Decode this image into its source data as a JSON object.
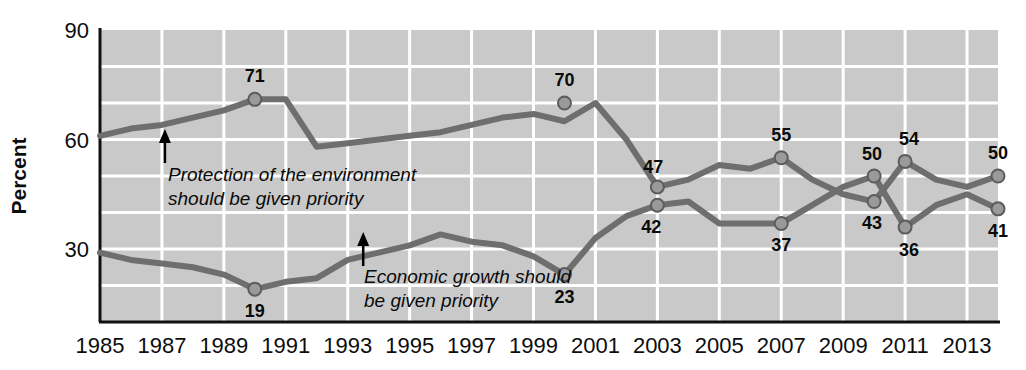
{
  "chart_data": {
    "type": "line",
    "title": "",
    "xlabel": "",
    "ylabel": "Percent",
    "ylim": [
      10,
      90
    ],
    "xlim": [
      1985,
      2014
    ],
    "grid": true,
    "legend_position": "inline-annotations",
    "y_ticks": [
      "90",
      "60",
      "30"
    ],
    "y_tick_values": [
      90,
      60,
      30
    ],
    "x_ticks": [
      "1985",
      "1987",
      "1989",
      "1991",
      "1993",
      "1995",
      "1997",
      "1999",
      "2001",
      "2003",
      "2005",
      "2007",
      "2009",
      "2011",
      "2013"
    ],
    "x_tick_values": [
      1985,
      1987,
      1989,
      1991,
      1993,
      1995,
      1997,
      1999,
      2001,
      2003,
      2005,
      2007,
      2009,
      2011,
      2013
    ],
    "x": [
      1985,
      1986,
      1987,
      1988,
      1989,
      1990,
      1991,
      1992,
      1993,
      1994,
      1995,
      1996,
      1997,
      1998,
      1999,
      2000,
      2001,
      2002,
      2003,
      2004,
      2005,
      2006,
      2007,
      2008,
      2009,
      2010,
      2011,
      2012,
      2013,
      2014
    ],
    "series": [
      {
        "name": "Protection of the environment should be given priority",
        "color": "#6e6e6e",
        "values": [
          61,
          63,
          64,
          66,
          68,
          71,
          71,
          58,
          59,
          60,
          61,
          62,
          64,
          66,
          67,
          65,
          70,
          60,
          47,
          49,
          53,
          52,
          55,
          49,
          45,
          43,
          54,
          49,
          47,
          50
        ],
        "labeled_points": [
          {
            "x": 1990,
            "value": 71,
            "label": "71"
          },
          {
            "x": 2000,
            "value": 70,
            "label": "70"
          },
          {
            "x": 2003,
            "value": 47,
            "label": "47"
          },
          {
            "x": 2007,
            "value": 55,
            "label": "55"
          },
          {
            "x": 2010,
            "value": 43,
            "label": "43"
          },
          {
            "x": 2011,
            "value": 54,
            "label": "54"
          },
          {
            "x": 2014,
            "value": 50,
            "label": "50"
          }
        ]
      },
      {
        "name": "Economic growth should be given priority",
        "color": "#6e6e6e",
        "values": [
          29,
          27,
          26,
          25,
          23,
          19,
          21,
          22,
          27,
          29,
          31,
          34,
          32,
          31,
          28,
          23,
          33,
          39,
          42,
          43,
          37,
          37,
          37,
          42,
          47,
          50,
          36,
          42,
          45,
          41
        ],
        "labeled_points": [
          {
            "x": 1990,
            "value": 19,
            "label": "19"
          },
          {
            "x": 2000,
            "value": 23,
            "label": "23"
          },
          {
            "x": 2003,
            "value": 42,
            "label": "42"
          },
          {
            "x": 2007,
            "value": 37,
            "label": "37"
          },
          {
            "x": 2010,
            "value": 50,
            "label": "50"
          },
          {
            "x": 2011,
            "value": 36,
            "label": "36"
          },
          {
            "x": 2014,
            "value": 41,
            "label": "41"
          }
        ]
      }
    ],
    "annotations": [
      {
        "id": "environment-annotation",
        "lines": [
          "Protection of the environment",
          "should be given priority"
        ],
        "arrow_target_x": 1987,
        "arrow_target_y": 64
      },
      {
        "id": "economy-annotation",
        "lines": [
          "Economic growth should",
          "be given priority"
        ],
        "arrow_target_x": 1993.5,
        "arrow_target_y": 29
      }
    ],
    "colors": {
      "plot_background": "#c9c9c9",
      "gridline": "#ffffff",
      "line": "#6e6e6e",
      "marker_fill": "#9a9a9a",
      "marker_stroke": "#5c5c5c",
      "axis": "#111111",
      "text": "#0b0b0b",
      "page_background": "#ffffff"
    }
  }
}
